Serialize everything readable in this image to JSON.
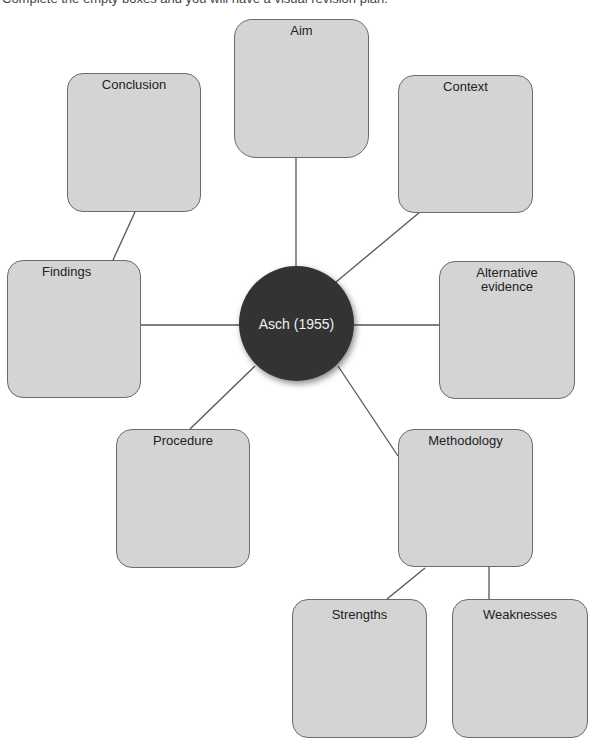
{
  "instruction": "Complete the empty boxes and you will have a visual revision plan.",
  "hub": {
    "label": "Asch (1955)",
    "color": "#333333"
  },
  "colors": {
    "box_fill": "#d4d4d4",
    "box_border": "#6b6b6b",
    "connector": "#555555"
  },
  "boxes": [
    {
      "id": "aim",
      "label": "Aim"
    },
    {
      "id": "conclusion",
      "label": "Conclusion"
    },
    {
      "id": "context",
      "label": "Context"
    },
    {
      "id": "findings",
      "label": "Findings"
    },
    {
      "id": "alternative-evidence",
      "label": "Alternative evidence"
    },
    {
      "id": "procedure",
      "label": "Procedure"
    },
    {
      "id": "methodology",
      "label": "Methodology"
    },
    {
      "id": "strengths",
      "label": "Strengths"
    },
    {
      "id": "weaknesses",
      "label": "Weaknesses"
    }
  ]
}
